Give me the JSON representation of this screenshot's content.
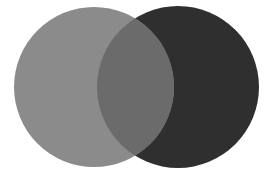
{
  "diagram": {
    "type": "venn",
    "background": "#ffffff",
    "circles": [
      {
        "name": "left-circle",
        "cx": 94,
        "cy": 87,
        "r": 80,
        "color": "#8b8b8b"
      },
      {
        "name": "right-circle",
        "cx": 178,
        "cy": 87,
        "r": 81,
        "color": "#2f2f2f"
      }
    ],
    "overlap_color": "#6b6b6b"
  }
}
